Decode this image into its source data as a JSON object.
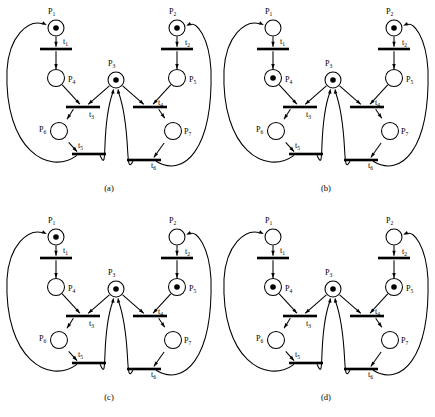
{
  "figure": {
    "type": "petri-net-figure",
    "panel_count": 4,
    "colors": {
      "stroke": "#000000",
      "fill": "#ffffff",
      "background": "#ffffff"
    }
  },
  "net": {
    "places": [
      {
        "id": "P1",
        "label": "P",
        "sub": "1",
        "cx": 56,
        "cy": 28,
        "r": 8,
        "label_x": 48,
        "label_y": 14
      },
      {
        "id": "P2",
        "label": "P",
        "sub": "2",
        "cx": 177,
        "cy": 28,
        "r": 8,
        "label_x": 169,
        "label_y": 14
      },
      {
        "id": "P3",
        "label": "P",
        "sub": "3",
        "cx": 116,
        "cy": 80,
        "r": 8,
        "label_x": 108,
        "label_y": 66
      },
      {
        "id": "P4",
        "label": "P",
        "sub": "4",
        "cx": 56,
        "cy": 78,
        "r": 8.5,
        "label_x": 68,
        "label_y": 82
      },
      {
        "id": "P5",
        "label": "P",
        "sub": "5",
        "cx": 177,
        "cy": 78,
        "r": 8.5,
        "label_x": 189,
        "label_y": 82
      },
      {
        "id": "P6",
        "label": "P",
        "sub": "6",
        "cx": 59,
        "cy": 131,
        "r": 8.5,
        "label_x": 39,
        "label_y": 132
      },
      {
        "id": "P7",
        "label": "P",
        "sub": "7",
        "cx": 173,
        "cy": 131,
        "r": 8.5,
        "label_x": 184,
        "label_y": 134
      }
    ],
    "transitions": [
      {
        "id": "t1",
        "label": "t",
        "sub": "1",
        "cx": 56,
        "cy": 49,
        "w": 32,
        "h": 2.6,
        "label_x": 63,
        "label_y": 44
      },
      {
        "id": "t2",
        "label": "t",
        "sub": "2",
        "cx": 177,
        "cy": 49,
        "w": 32,
        "h": 2.6,
        "label_x": 185,
        "label_y": 45
      },
      {
        "id": "t3",
        "label": "t",
        "sub": "3",
        "cx": 83,
        "cy": 107,
        "w": 34,
        "h": 2.6,
        "label_x": 89,
        "label_y": 117
      },
      {
        "id": "t4",
        "label": "t",
        "sub": "4",
        "cx": 150,
        "cy": 107,
        "w": 34,
        "h": 2.6,
        "label_x": 158,
        "label_y": 105
      },
      {
        "id": "t5",
        "label": "t",
        "sub": "5",
        "cx": 89,
        "cy": 154,
        "w": 34,
        "h": 2.6,
        "label_x": 78,
        "label_y": 148
      },
      {
        "id": "t6",
        "label": "t",
        "sub": "6",
        "cx": 144,
        "cy": 160,
        "w": 34,
        "h": 2.6,
        "label_x": 151,
        "label_y": 168
      }
    ],
    "arcs": [
      "P1->t1",
      "t1->P4",
      "P4->t3",
      "P3->t3",
      "t3->P6",
      "P6->t5",
      "t5->P3",
      "t5->P1",
      "P2->t2",
      "t2->P5",
      "P5->t4",
      "P3->t4",
      "t4->P7",
      "P7->t6",
      "t6->P3",
      "t6->P2"
    ]
  },
  "panels": [
    {
      "id": "a",
      "caption": "(a)",
      "caption_x": 109,
      "caption_y": 191,
      "tokens": {
        "P1": 1,
        "P2": 1,
        "P3": 1,
        "P4": 0,
        "P5": 0,
        "P6": 0,
        "P7": 0
      },
      "marking_vector": "(1,1,1,0,0,0,0)"
    },
    {
      "id": "b",
      "caption": "(b)",
      "caption_x": 109,
      "caption_y": 191,
      "tokens": {
        "P1": 0,
        "P2": 1,
        "P3": 1,
        "P4": 1,
        "P5": 0,
        "P6": 0,
        "P7": 0
      },
      "marking_vector": "(0,1,1,1,0,0,0)"
    },
    {
      "id": "c",
      "caption": "(c)",
      "caption_x": 109,
      "caption_y": 191,
      "tokens": {
        "P1": 1,
        "P2": 0,
        "P3": 1,
        "P4": 0,
        "P5": 1,
        "P6": 0,
        "P7": 0
      },
      "marking_vector": "(1,0,1,0,1,0,0)"
    },
    {
      "id": "d",
      "caption": "(d)",
      "caption_x": 109,
      "caption_y": 191,
      "tokens": {
        "P1": 0,
        "P2": 0,
        "P3": 1,
        "P4": 1,
        "P5": 1,
        "P6": 0,
        "P7": 0
      },
      "marking_vector": "(0,0,1,1,1,0,0)"
    }
  ],
  "panel_positions": [
    {
      "id": "a",
      "left": 0,
      "top": 0
    },
    {
      "id": "b",
      "left": 217,
      "top": 0
    },
    {
      "id": "c",
      "left": 0,
      "top": 209
    },
    {
      "id": "d",
      "left": 217,
      "top": 209
    }
  ]
}
